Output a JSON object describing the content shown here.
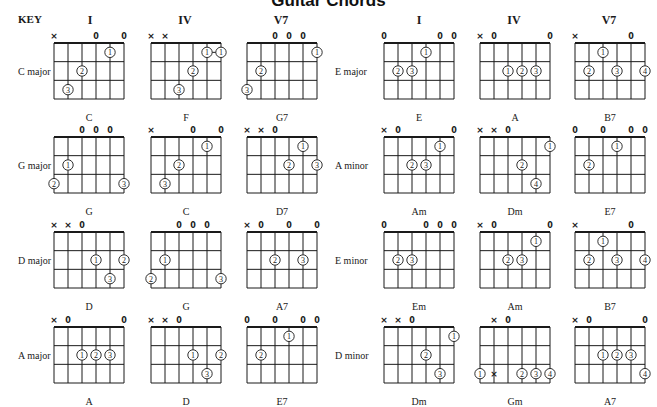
{
  "title": "Guitar Chords",
  "header": {
    "key_label": "KEY",
    "left_columns": [
      "I",
      "IV",
      "V7"
    ],
    "right_columns": [
      "I",
      "IV",
      "V7"
    ]
  },
  "legend_note": "Strings ordered low E (6th) to high E (1st); x = not played, 0 = open; circled numbers = finger on fret 1-3",
  "keys": [
    {
      "label": "C  major",
      "side": "left",
      "row": 0,
      "chords": [
        {
          "name": "C",
          "strings": [
            "x",
            "",
            "",
            "0",
            "",
            "0"
          ],
          "dots": [
            {
              "s": 4,
              "f": 1,
              "n": "1"
            },
            {
              "s": 2,
              "f": 2,
              "n": "2"
            },
            {
              "s": 1,
              "f": 3,
              "n": "3"
            }
          ]
        },
        {
          "name": "F",
          "strings": [
            "x",
            "x",
            "",
            "",
            "",
            ""
          ],
          "barre": {
            "from": 4,
            "to": 5,
            "f": 1
          },
          "dots": [
            {
              "s": 4,
              "f": 1,
              "n": "1"
            },
            {
              "s": 5,
              "f": 1,
              "n": "1"
            },
            {
              "s": 3,
              "f": 2,
              "n": "2"
            },
            {
              "s": 2,
              "f": 3,
              "n": "3"
            }
          ]
        },
        {
          "name": "G7",
          "strings": [
            "",
            "",
            "0",
            "0",
            "0",
            ""
          ],
          "dots": [
            {
              "s": 5,
              "f": 1,
              "n": "1"
            },
            {
              "s": 1,
              "f": 2,
              "n": "2"
            },
            {
              "s": 0,
              "f": 3,
              "n": "3"
            }
          ]
        }
      ]
    },
    {
      "label": "G  major",
      "side": "left",
      "row": 1,
      "chords": [
        {
          "name": "G",
          "strings": [
            "",
            "",
            "0",
            "0",
            "0",
            ""
          ],
          "dots": [
            {
              "s": 1,
              "f": 2,
              "n": "1"
            },
            {
              "s": 0,
              "f": 3,
              "n": "2"
            },
            {
              "s": 5,
              "f": 3,
              "n": "3"
            }
          ]
        },
        {
          "name": "C",
          "strings": [
            "x",
            "",
            "",
            "0",
            "",
            "0"
          ],
          "dots": [
            {
              "s": 4,
              "f": 1,
              "n": "1"
            },
            {
              "s": 2,
              "f": 2,
              "n": "2"
            },
            {
              "s": 1,
              "f": 3,
              "n": "3"
            }
          ]
        },
        {
          "name": "D7",
          "strings": [
            "x",
            "x",
            "0",
            "",
            "",
            ""
          ],
          "dots": [
            {
              "s": 4,
              "f": 1,
              "n": "1"
            },
            {
              "s": 3,
              "f": 2,
              "n": "2"
            },
            {
              "s": 5,
              "f": 2,
              "n": "3"
            }
          ]
        }
      ]
    },
    {
      "label": "D  major",
      "side": "left",
      "row": 2,
      "chords": [
        {
          "name": "D",
          "strings": [
            "x",
            "x",
            "0",
            "",
            "",
            ""
          ],
          "dots": [
            {
              "s": 3,
              "f": 2,
              "n": "1"
            },
            {
              "s": 5,
              "f": 2,
              "n": "2"
            },
            {
              "s": 4,
              "f": 3,
              "n": "3"
            }
          ]
        },
        {
          "name": "G",
          "strings": [
            "",
            "",
            "0",
            "0",
            "0",
            ""
          ],
          "dots": [
            {
              "s": 1,
              "f": 2,
              "n": "1"
            },
            {
              "s": 0,
              "f": 3,
              "n": "2"
            },
            {
              "s": 5,
              "f": 3,
              "n": "3"
            }
          ]
        },
        {
          "name": "A7",
          "strings": [
            "x",
            "0",
            "",
            "0",
            "",
            "0"
          ],
          "dots": [
            {
              "s": 2,
              "f": 2,
              "n": "2"
            },
            {
              "s": 4,
              "f": 2,
              "n": "3"
            }
          ]
        }
      ]
    },
    {
      "label": "A  major",
      "side": "left",
      "row": 3,
      "chords": [
        {
          "name": "A",
          "strings": [
            "x",
            "0",
            "",
            "",
            "",
            "0"
          ],
          "dots": [
            {
              "s": 2,
              "f": 2,
              "n": "1"
            },
            {
              "s": 3,
              "f": 2,
              "n": "2"
            },
            {
              "s": 4,
              "f": 2,
              "n": "3"
            }
          ]
        },
        {
          "name": "D",
          "strings": [
            "x",
            "x",
            "0",
            "",
            "",
            ""
          ],
          "dots": [
            {
              "s": 3,
              "f": 2,
              "n": "1"
            },
            {
              "s": 5,
              "f": 2,
              "n": "2"
            },
            {
              "s": 4,
              "f": 3,
              "n": "3"
            }
          ]
        },
        {
          "name": "E7",
          "strings": [
            "0",
            "",
            "0",
            "",
            "0",
            "0"
          ],
          "dots": [
            {
              "s": 3,
              "f": 1,
              "n": "1"
            },
            {
              "s": 1,
              "f": 2,
              "n": "2"
            }
          ]
        }
      ]
    },
    {
      "label": "E  major",
      "side": "right",
      "row": 0,
      "chords": [
        {
          "name": "E",
          "strings": [
            "0",
            "",
            "",
            "",
            "0",
            "0"
          ],
          "dots": [
            {
              "s": 3,
              "f": 1,
              "n": "1"
            },
            {
              "s": 1,
              "f": 2,
              "n": "2"
            },
            {
              "s": 2,
              "f": 2,
              "n": "3"
            }
          ]
        },
        {
          "name": "A",
          "strings": [
            "x",
            "0",
            "",
            "",
            "",
            "0"
          ],
          "dots": [
            {
              "s": 2,
              "f": 2,
              "n": "1"
            },
            {
              "s": 3,
              "f": 2,
              "n": "2"
            },
            {
              "s": 4,
              "f": 2,
              "n": "3"
            }
          ]
        },
        {
          "name": "B7",
          "strings": [
            "x",
            "",
            "",
            "",
            "0",
            ""
          ],
          "dots": [
            {
              "s": 2,
              "f": 1,
              "n": "1"
            },
            {
              "s": 1,
              "f": 2,
              "n": "2"
            },
            {
              "s": 3,
              "f": 2,
              "n": "3"
            },
            {
              "s": 5,
              "f": 2,
              "n": "4"
            }
          ]
        }
      ]
    },
    {
      "label": "A minor",
      "side": "right",
      "row": 1,
      "chords": [
        {
          "name": "Am",
          "strings": [
            "x",
            "0",
            "",
            "",
            "",
            "0"
          ],
          "dots": [
            {
              "s": 4,
              "f": 1,
              "n": "1"
            },
            {
              "s": 2,
              "f": 2,
              "n": "2"
            },
            {
              "s": 3,
              "f": 2,
              "n": "3"
            }
          ]
        },
        {
          "name": "Dm",
          "strings": [
            "x",
            "x",
            "0",
            "",
            "",
            ""
          ],
          "dots": [
            {
              "s": 5,
              "f": 1,
              "n": "1"
            },
            {
              "s": 3,
              "f": 2,
              "n": "2"
            },
            {
              "s": 4,
              "f": 3,
              "n": "4"
            }
          ]
        },
        {
          "name": "E7",
          "strings": [
            "0",
            "",
            "0",
            "",
            "0",
            "0"
          ],
          "dots": [
            {
              "s": 3,
              "f": 1,
              "n": "1"
            },
            {
              "s": 1,
              "f": 2,
              "n": "2"
            }
          ]
        }
      ]
    },
    {
      "label": "E  minor",
      "side": "right",
      "row": 2,
      "chords": [
        {
          "name": "Em",
          "strings": [
            "0",
            "",
            "",
            "0",
            "0",
            "0"
          ],
          "dots": [
            {
              "s": 1,
              "f": 2,
              "n": "2"
            },
            {
              "s": 2,
              "f": 2,
              "n": "3"
            }
          ]
        },
        {
          "name": "Am",
          "strings": [
            "x",
            "0",
            "",
            "",
            "",
            "0"
          ],
          "dots": [
            {
              "s": 4,
              "f": 1,
              "n": "1"
            },
            {
              "s": 2,
              "f": 2,
              "n": "2"
            },
            {
              "s": 3,
              "f": 2,
              "n": "3"
            }
          ]
        },
        {
          "name": "B7",
          "strings": [
            "x",
            "",
            "",
            "",
            "0",
            ""
          ],
          "dots": [
            {
              "s": 2,
              "f": 1,
              "n": "1"
            },
            {
              "s": 1,
              "f": 2,
              "n": "2"
            },
            {
              "s": 3,
              "f": 2,
              "n": "3"
            },
            {
              "s": 5,
              "f": 2,
              "n": "4"
            }
          ]
        }
      ]
    },
    {
      "label": "D  minor",
      "side": "right",
      "row": 3,
      "chords": [
        {
          "name": "Dm",
          "strings": [
            "x",
            "x",
            "0",
            "",
            "",
            ""
          ],
          "dots": [
            {
              "s": 5,
              "f": 1,
              "n": "1"
            },
            {
              "s": 3,
              "f": 2,
              "n": "2"
            },
            {
              "s": 4,
              "f": 3,
              "n": "3"
            }
          ]
        },
        {
          "name": "Gm",
          "strings": [
            "",
            "x",
            "0",
            "",
            "",
            ""
          ],
          "fretted_mute": [
            {
              "s": 1,
              "f": 3
            }
          ],
          "dots": [
            {
              "s": 0,
              "f": 3,
              "n": "1"
            },
            {
              "s": 3,
              "f": 3,
              "n": "2"
            },
            {
              "s": 4,
              "f": 3,
              "n": "3"
            },
            {
              "s": 5,
              "f": 3,
              "n": "4"
            }
          ]
        },
        {
          "name": "A7",
          "strings": [
            "x",
            "0",
            "",
            "",
            "",
            "0"
          ],
          "dots": [
            {
              "s": 2,
              "f": 2,
              "n": "1"
            },
            {
              "s": 3,
              "f": 2,
              "n": "2"
            },
            {
              "s": 4,
              "f": 2,
              "n": "3"
            },
            {
              "s": 5,
              "f": 3,
              "n": "4"
            }
          ]
        }
      ]
    }
  ],
  "colors": {
    "ink": "#1a1a1a",
    "paper": "#ffffff"
  }
}
